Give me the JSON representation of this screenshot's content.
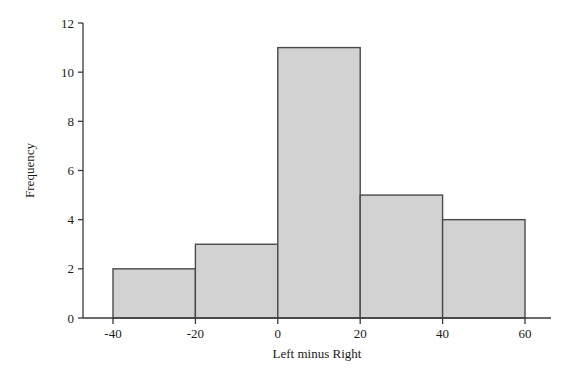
{
  "chart_data": {
    "type": "bar",
    "title": "",
    "subtitle": "",
    "xlabel": "Left minus Right",
    "ylabel": "Frequency",
    "categories": [
      "-40 to -20",
      "-20 to 0",
      "0 to 20",
      "20 to 40",
      "40 to 60"
    ],
    "bin_edges": [
      -40,
      -20,
      0,
      20,
      40,
      60
    ],
    "values": [
      2,
      3,
      11,
      5,
      4
    ],
    "xlim": [
      -48,
      68
    ],
    "ylim": [
      0,
      12
    ],
    "xticks": [
      -40,
      -20,
      0,
      20,
      40,
      60
    ],
    "xtick_labels": [
      "-40",
      "-20",
      "0",
      "20",
      "40",
      "60"
    ],
    "yticks": [
      0,
      2,
      4,
      6,
      8,
      10,
      12
    ],
    "ytick_labels": [
      "0",
      "2",
      "4",
      "6",
      "8",
      "10",
      "12"
    ],
    "grid": false,
    "legend": false,
    "legend_position": "none",
    "bar_fill_color": "#d2d2d2",
    "bar_edge_color": "#4a4a4a",
    "axis_color": "#3a3a3a",
    "background_color": "#ffffff"
  }
}
